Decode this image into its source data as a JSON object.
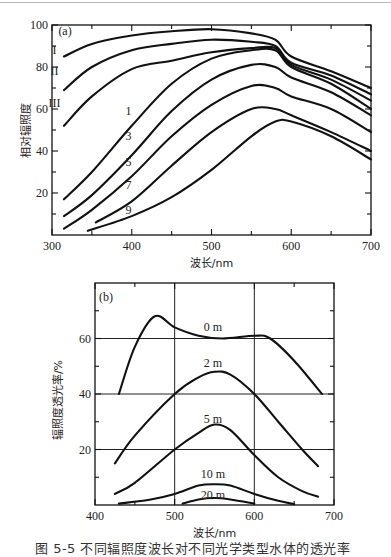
{
  "figure_caption": "图 5-5  不同辐照度波长对不同光学类型水体的透光率",
  "chart_data": [
    {
      "type": "line",
      "panel": "(a)",
      "title": "",
      "xlabel": "波长/nm",
      "ylabel": "相对辐照度",
      "xlim": [
        300,
        700
      ],
      "ylim": [
        0,
        100
      ],
      "xticks": [
        300,
        400,
        500,
        600,
        700
      ],
      "yticks": [
        20,
        40,
        60,
        80,
        100
      ],
      "grid": false,
      "series": [
        {
          "name": "I",
          "x": [
            315,
            350,
            400,
            450,
            500,
            550,
            580,
            600,
            650,
            700
          ],
          "values": [
            85,
            91,
            95,
            97,
            98,
            96,
            93,
            85,
            78,
            70
          ]
        },
        {
          "name": "II",
          "x": [
            315,
            350,
            400,
            450,
            500,
            550,
            580,
            600,
            650,
            700
          ],
          "values": [
            69,
            80,
            88,
            91,
            93,
            92,
            90,
            82,
            76,
            67
          ]
        },
        {
          "name": "III",
          "x": [
            315,
            350,
            400,
            450,
            500,
            550,
            580,
            600,
            650,
            700
          ],
          "values": [
            52,
            66,
            79,
            83,
            87,
            89,
            89,
            81,
            74,
            64
          ]
        },
        {
          "name": "1",
          "x": [
            315,
            350,
            400,
            450,
            500,
            550,
            580,
            600,
            650,
            700
          ],
          "values": [
            17,
            30,
            52,
            72,
            84,
            88,
            88,
            80,
            72,
            60
          ]
        },
        {
          "name": "3",
          "x": [
            315,
            350,
            400,
            450,
            500,
            550,
            580,
            600,
            650,
            700
          ],
          "values": [
            9,
            19,
            38,
            59,
            74,
            81,
            80,
            75,
            68,
            57
          ]
        },
        {
          "name": "5",
          "x": [
            315,
            350,
            400,
            450,
            500,
            550,
            580,
            600,
            650,
            700
          ],
          "values": [
            3,
            12,
            28,
            47,
            62,
            71,
            70,
            66,
            60,
            49
          ]
        },
        {
          "name": "7",
          "x": [
            355,
            400,
            450,
            500,
            550,
            580,
            600,
            650,
            700
          ],
          "values": [
            6,
            16,
            33,
            49,
            60,
            60,
            57,
            49,
            40
          ]
        },
        {
          "name": "9",
          "x": [
            345,
            400,
            450,
            500,
            550,
            580,
            600,
            650,
            700
          ],
          "values": [
            2,
            9,
            18,
            31,
            47,
            54,
            54,
            47,
            36
          ]
        }
      ],
      "annotations": [
        {
          "text": "(a)",
          "x": 308,
          "y": 97
        },
        {
          "text": "I",
          "x": 303,
          "y": 88
        },
        {
          "text": "II",
          "x": 303,
          "y": 78
        },
        {
          "text": "III",
          "x": 303,
          "y": 63
        },
        {
          "text": "1",
          "x": 396,
          "y": 59
        },
        {
          "text": "3",
          "x": 396,
          "y": 47
        },
        {
          "text": "5",
          "x": 396,
          "y": 35
        },
        {
          "text": "7",
          "x": 396,
          "y": 24
        },
        {
          "text": "9",
          "x": 396,
          "y": 12
        }
      ]
    },
    {
      "type": "line",
      "panel": "(b)",
      "title": "",
      "xlabel": "波长/nm",
      "ylabel": "辐照度透光率/%",
      "xlim": [
        400,
        700
      ],
      "ylim": [
        0,
        80
      ],
      "xticks": [
        400,
        500,
        600,
        700
      ],
      "yticks": [
        20,
        40,
        60
      ],
      "grid": true,
      "series": [
        {
          "name": "0 m",
          "x": [
            430,
            450,
            475,
            500,
            530,
            560,
            600,
            620,
            650,
            685
          ],
          "values": [
            40,
            57,
            68,
            64,
            61,
            60,
            61,
            60,
            52,
            40
          ]
        },
        {
          "name": "2 m",
          "x": [
            425,
            450,
            500,
            530,
            550,
            570,
            600,
            630,
            660,
            680
          ],
          "values": [
            15,
            25,
            40,
            46,
            48,
            47,
            40,
            30,
            20,
            14
          ]
        },
        {
          "name": "5 m",
          "x": [
            425,
            450,
            500,
            530,
            550,
            570,
            600,
            630,
            660,
            680
          ],
          "values": [
            4,
            8,
            20,
            26,
            29,
            27,
            18,
            10,
            5,
            3
          ]
        },
        {
          "name": "10 m",
          "x": [
            430,
            470,
            500,
            530,
            550,
            570,
            600,
            630,
            650
          ],
          "values": [
            0.5,
            2,
            4,
            7,
            7.5,
            7,
            4,
            1.5,
            0.3
          ]
        },
        {
          "name": "20 m",
          "x": [
            510,
            530,
            550,
            570,
            600
          ],
          "values": [
            0.5,
            2,
            2.5,
            2,
            0.5
          ]
        }
      ],
      "annotations": [
        {
          "text": "(b)",
          "x": 405,
          "y": 75
        },
        {
          "text": "0 m",
          "x": 548,
          "y": 64
        },
        {
          "text": "2 m",
          "x": 548,
          "y": 51
        },
        {
          "text": "5 m",
          "x": 548,
          "y": 31
        },
        {
          "text": "10 m",
          "x": 548,
          "y": 11
        },
        {
          "text": "20 m",
          "x": 548,
          "y": 3.5
        }
      ]
    }
  ]
}
